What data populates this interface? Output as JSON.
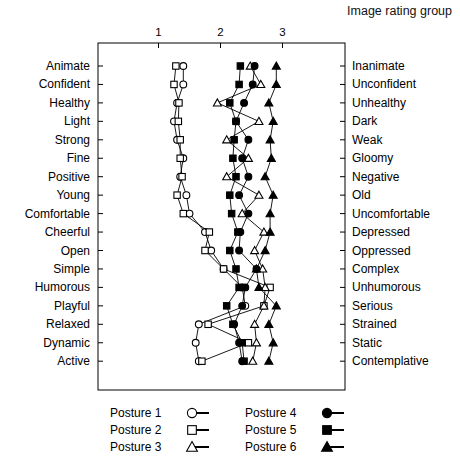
{
  "chart": {
    "title": "Image rating group",
    "axis": {
      "ticks": [
        "1",
        "2",
        "3"
      ],
      "tick_values": [
        1,
        2,
        3
      ],
      "range": [
        0.55,
        3.55
      ]
    }
  },
  "legend": {
    "items": [
      {
        "label": "Posture 1",
        "marker": "open-circle"
      },
      {
        "label": "Posture 2",
        "marker": "open-square"
      },
      {
        "label": "Posture 3",
        "marker": "open-triangle"
      },
      {
        "label": "Posture 4",
        "marker": "filled-circle"
      },
      {
        "label": "Posture 5",
        "marker": "filled-square"
      },
      {
        "label": "Posture 6",
        "marker": "filled-triangle"
      }
    ]
  },
  "chart_data": {
    "type": "line",
    "title": "Image rating group",
    "xlabel": "",
    "ylabel": "",
    "xlim": [
      0.55,
      3.55
    ],
    "grid": false,
    "legend_position": "bottom",
    "orientation": "horizontal-profile",
    "categories": [
      "Animate",
      "Confident",
      "Healthy",
      "Light",
      "Strong",
      "Fine",
      "Positive",
      "Young",
      "Comfortable",
      "Cheerful",
      "Open",
      "Simple",
      "Humorous",
      "Playful",
      "Relaxed",
      "Dynamic",
      "Active"
    ],
    "categories_right": [
      "Inanimate",
      "Unconfident",
      "Unhealthy",
      "Dark",
      "Weak",
      "Gloomy",
      "Negative",
      "Old",
      "Uncomfortable",
      "Depressed",
      "Oppressed",
      "Complex",
      "Unhumorous",
      "Serious",
      "Strained",
      "Static",
      "Contemplative"
    ],
    "series": [
      {
        "name": "Posture 1",
        "marker": "open-circle",
        "values": [
          1.4,
          1.4,
          1.3,
          1.25,
          1.3,
          1.4,
          1.35,
          1.45,
          1.5,
          1.75,
          1.85,
          2.05,
          2.35,
          2.4,
          1.65,
          1.6,
          1.65
        ]
      },
      {
        "name": "Posture 2",
        "marker": "open-square",
        "values": [
          1.28,
          1.25,
          1.33,
          1.32,
          1.35,
          1.35,
          1.38,
          1.3,
          1.4,
          1.82,
          1.75,
          2.05,
          2.8,
          2.7,
          1.8,
          2.45,
          1.7
        ]
      },
      {
        "name": "Posture 3",
        "marker": "open-triangle",
        "values": [
          2.48,
          2.65,
          1.95,
          2.62,
          2.1,
          2.45,
          2.1,
          2.62,
          2.35,
          2.7,
          2.55,
          2.68,
          2.72,
          2.7,
          2.55,
          2.58,
          2.52
        ]
      },
      {
        "name": "Posture 4",
        "marker": "filled-circle",
        "values": [
          2.55,
          2.52,
          2.38,
          2.25,
          2.45,
          2.35,
          2.45,
          2.3,
          2.45,
          2.32,
          2.3,
          2.58,
          2.4,
          2.35,
          2.22,
          2.3,
          2.35
        ]
      },
      {
        "name": "Posture 5",
        "marker": "filled-square",
        "values": [
          2.32,
          2.3,
          2.15,
          2.25,
          2.22,
          2.2,
          2.25,
          2.15,
          2.18,
          2.28,
          2.15,
          2.25,
          2.3,
          2.1,
          2.2,
          2.35,
          2.38
        ]
      },
      {
        "name": "Posture 6",
        "marker": "filled-triangle",
        "values": [
          2.9,
          2.9,
          2.78,
          2.85,
          2.8,
          2.82,
          2.72,
          2.85,
          2.8,
          2.8,
          2.72,
          2.58,
          2.62,
          2.9,
          2.78,
          2.85,
          2.78
        ]
      }
    ]
  }
}
